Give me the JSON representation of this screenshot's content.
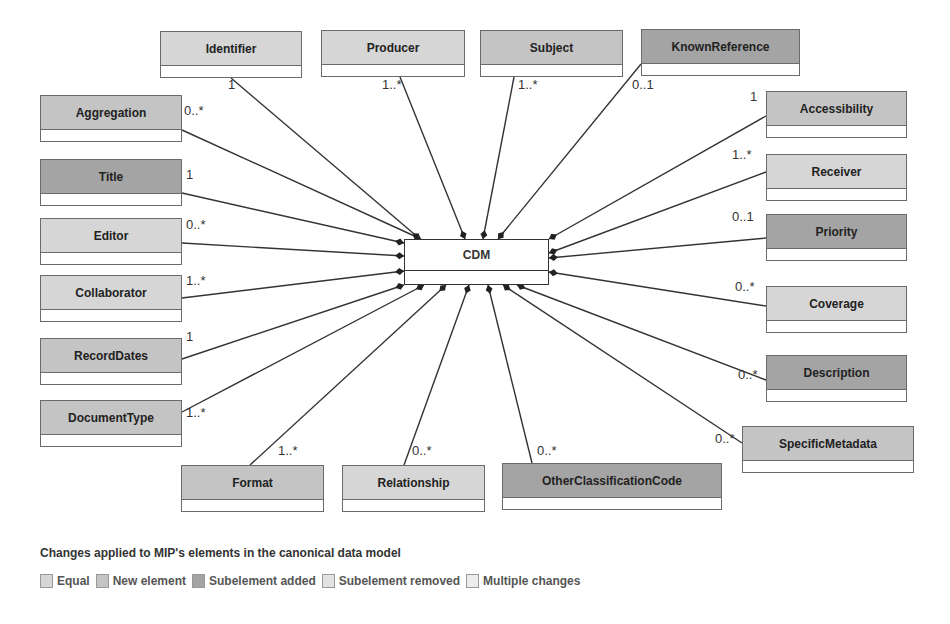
{
  "diagram": {
    "center": {
      "label": "CDM",
      "x": 404,
      "y": 239,
      "w": 145,
      "h": 46
    },
    "palette": {
      "equal": "#d6d6d6",
      "new_element": "#c4c4c4",
      "subelement_added": "#a4a4a4",
      "subelement_removed": "#e2e2e2",
      "multiple_changes": "#ececec"
    },
    "classes": [
      {
        "id": "identifier",
        "label": "Identifier",
        "x": 160,
        "y": 31,
        "w": 142,
        "status": "equal",
        "multiplicity": "1",
        "mx": 228,
        "my": 86,
        "ax": 231,
        "ay": 78,
        "tx": 420,
        "ty": 239
      },
      {
        "id": "producer",
        "label": "Producer",
        "x": 321,
        "y": 30,
        "w": 144,
        "status": "equal",
        "multiplicity": "1..*",
        "mx": 382,
        "my": 86,
        "ax": 400,
        "ay": 77,
        "tx": 465,
        "ty": 239
      },
      {
        "id": "subject",
        "label": "Subject",
        "x": 480,
        "y": 30,
        "w": 143,
        "status": "new_element",
        "multiplicity": "1..*",
        "mx": 518,
        "my": 86,
        "ax": 514,
        "ay": 77,
        "tx": 483,
        "ty": 239
      },
      {
        "id": "knownreference",
        "label": "KnownReference",
        "x": 641,
        "y": 29,
        "w": 159,
        "status": "subelement_added",
        "multiplicity": "0..1",
        "mx": 632,
        "my": 86,
        "ax": 641,
        "ay": 64,
        "tx": 498,
        "ty": 239
      },
      {
        "id": "aggregation",
        "label": "Aggregation",
        "x": 40,
        "y": 95,
        "w": 142,
        "status": "new_element",
        "multiplicity": "0..*",
        "mx": 184,
        "my": 112,
        "ax": 182,
        "ay": 130,
        "tx": 421,
        "ty": 239
      },
      {
        "id": "title",
        "label": "Title",
        "x": 40,
        "y": 159,
        "w": 142,
        "status": "subelement_added",
        "multiplicity": "1",
        "mx": 186,
        "my": 176,
        "ax": 182,
        "ay": 193,
        "tx": 404,
        "ty": 243
      },
      {
        "id": "editor",
        "label": "Editor",
        "x": 40,
        "y": 218,
        "w": 142,
        "status": "equal",
        "multiplicity": "0..*",
        "mx": 186,
        "my": 226,
        "ax": 182,
        "ay": 243,
        "tx": 404,
        "ty": 256
      },
      {
        "id": "collaborator",
        "label": "Collaborator",
        "x": 40,
        "y": 275,
        "w": 142,
        "status": "equal",
        "multiplicity": "1..*",
        "mx": 186,
        "my": 282,
        "ax": 182,
        "ay": 298,
        "tx": 404,
        "ty": 271
      },
      {
        "id": "recorddates",
        "label": "RecordDates",
        "x": 40,
        "y": 338,
        "w": 142,
        "status": "new_element",
        "multiplicity": "1",
        "mx": 186,
        "my": 338,
        "ax": 182,
        "ay": 359,
        "tx": 404,
        "ty": 285
      },
      {
        "id": "documenttype",
        "label": "DocumentType",
        "x": 40,
        "y": 400,
        "w": 142,
        "status": "new_element",
        "multiplicity": "1..*",
        "mx": 186,
        "my": 414,
        "ax": 182,
        "ay": 412,
        "tx": 424,
        "ty": 285
      },
      {
        "id": "format",
        "label": "Format",
        "x": 181,
        "y": 465,
        "w": 143,
        "status": "new_element",
        "multiplicity": "1..*",
        "mx": 278,
        "my": 452,
        "ax": 250,
        "ay": 465,
        "tx": 446,
        "ty": 285
      },
      {
        "id": "relationship",
        "label": "Relationship",
        "x": 342,
        "y": 465,
        "w": 143,
        "status": "equal",
        "multiplicity": "0..*",
        "mx": 412,
        "my": 452,
        "ax": 404,
        "ay": 465,
        "tx": 469,
        "ty": 285
      },
      {
        "id": "otherclassificationcode",
        "label": "OtherClassificationCode",
        "x": 502,
        "y": 463,
        "w": 220,
        "status": "subelement_added",
        "multiplicity": "0..*",
        "mx": 537,
        "my": 452,
        "ax": 532,
        "ay": 463,
        "tx": 488,
        "ty": 285
      },
      {
        "id": "accessibility",
        "label": "Accessibility",
        "x": 766,
        "y": 91,
        "w": 141,
        "status": "new_element",
        "multiplicity": "1",
        "mx": 750,
        "my": 98,
        "ax": 766,
        "ay": 116,
        "tx": 549,
        "ty": 239
      },
      {
        "id": "receiver",
        "label": "Receiver",
        "x": 766,
        "y": 154,
        "w": 141,
        "status": "equal",
        "multiplicity": "1..*",
        "mx": 732,
        "my": 156,
        "ax": 766,
        "ay": 172,
        "tx": 549,
        "ty": 253
      },
      {
        "id": "priority",
        "label": "Priority",
        "x": 766,
        "y": 214,
        "w": 141,
        "status": "subelement_added",
        "multiplicity": "0..1",
        "mx": 732,
        "my": 218,
        "ax": 766,
        "ay": 238,
        "tx": 549,
        "ty": 258
      },
      {
        "id": "coverage",
        "label": "Coverage",
        "x": 766,
        "y": 286,
        "w": 141,
        "status": "equal",
        "multiplicity": "0..*",
        "mx": 735,
        "my": 288,
        "ax": 766,
        "ay": 306,
        "tx": 549,
        "ty": 272
      },
      {
        "id": "description",
        "label": "Description",
        "x": 766,
        "y": 355,
        "w": 141,
        "status": "subelement_added",
        "multiplicity": "0..*",
        "mx": 738,
        "my": 376,
        "ax": 766,
        "ay": 380,
        "tx": 517,
        "ty": 285
      },
      {
        "id": "specificmetadata",
        "label": "SpecificMetadata",
        "x": 742,
        "y": 426,
        "w": 172,
        "status": "new_element",
        "multiplicity": "0..*",
        "mx": 715,
        "my": 440,
        "ax": 742,
        "ay": 443,
        "tx": 503,
        "ty": 285
      }
    ]
  },
  "legend": {
    "title": "Changes applied to MIP's elements in the canonical data model",
    "items": [
      {
        "key": "equal",
        "label": "Equal"
      },
      {
        "key": "new_element",
        "label": "New element"
      },
      {
        "key": "subelement_added",
        "label": "Subelement added"
      },
      {
        "key": "subelement_removed",
        "label": "Subelement removed"
      },
      {
        "key": "multiple_changes",
        "label": "Multiple changes"
      }
    ]
  }
}
